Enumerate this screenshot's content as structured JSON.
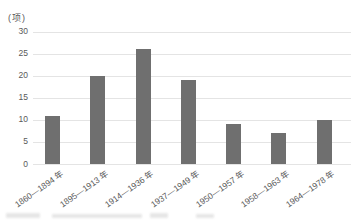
{
  "chart_data": {
    "type": "bar",
    "title": "",
    "ylabel": "(项)",
    "xlabel": "",
    "categories": [
      "1860—1894 年",
      "1895—1913 年",
      "1914—1936 年",
      "1937—1949 年",
      "1950—1957 年",
      "1958—1963 年",
      "1964—1978 年"
    ],
    "values": [
      11,
      20,
      26,
      19,
      9,
      7,
      10
    ],
    "yticks": [
      0,
      5,
      10,
      15,
      20,
      25,
      30
    ],
    "ylim": [
      0,
      30
    ],
    "grid": "horizontal",
    "legend": "none",
    "colors": {
      "bar": "#6f6f6f",
      "gridline": "#e4e4e4",
      "axis_text": "#595959",
      "background": "#ffffff"
    }
  }
}
